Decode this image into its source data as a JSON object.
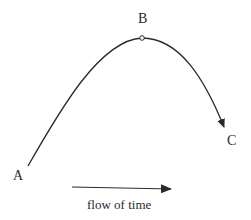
{
  "diagram": {
    "points": {
      "a": {
        "label": "A"
      },
      "b": {
        "label": "B"
      },
      "c": {
        "label": "C"
      }
    },
    "time_arrow": {
      "label": "flow of time"
    },
    "colors": {
      "stroke": "#2a2a2a",
      "background": "#ffffff"
    }
  }
}
